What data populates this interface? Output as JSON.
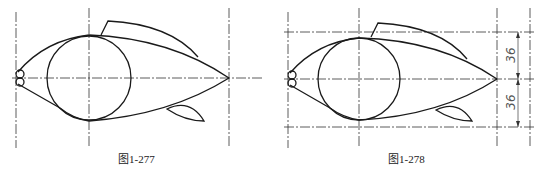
{
  "figures": [
    {
      "id": "fig-1",
      "caption": "图1-277"
    },
    {
      "id": "fig-2",
      "caption": "图1-278",
      "dimensions": [
        "36",
        "36"
      ]
    }
  ],
  "colors": {
    "stroke": "#1a1a1a",
    "centerline": "#333333",
    "dimension": "#555555"
  }
}
